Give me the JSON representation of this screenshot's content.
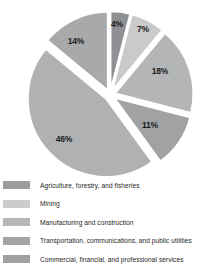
{
  "chart_data": {
    "type": "pie",
    "title": "",
    "subtitle": "",
    "xlabel": "",
    "ylabel": "",
    "grid": false,
    "legend_position": "bottom",
    "exploded": true,
    "start_angle_deg": 0,
    "direction": "clockwise",
    "categories": [
      "Agriculture, forestry, and fisheries",
      "Mining",
      "Manufacturing and construction",
      "Transportation, communications, and public utilities",
      "Commercial, financial, and professional services"
    ],
    "values": [
      4,
      7,
      18,
      11,
      46
    ],
    "slices": [
      {
        "label": "4%",
        "value": 4,
        "category": "Agriculture, forestry, and fisheries",
        "color": "#8f9093",
        "start_deg": 0,
        "end_deg": 14.4,
        "label_x": 117,
        "label_y": 24
      },
      {
        "label": "7%",
        "value": 7,
        "category": "Mining",
        "color": "#c9cacb",
        "start_deg": 14.4,
        "end_deg": 39.6,
        "label_x": 143,
        "label_y": 29
      },
      {
        "label": "18%",
        "value": 18,
        "category": "Manufacturing and construction",
        "color": "#b4b5b7",
        "start_deg": 39.6,
        "end_deg": 104.4,
        "label_x": 160,
        "label_y": 71
      },
      {
        "label": "11%",
        "value": 11,
        "category": "Transportation, communications, and public utilities",
        "color": "#a1a2a4",
        "start_deg": 104.4,
        "end_deg": 144.0,
        "label_x": 150,
        "label_y": 125
      },
      {
        "label": "46%",
        "value": 46,
        "category": "Commercial, financial, and professional services",
        "color": "#b0b1b3",
        "start_deg": 144.0,
        "end_deg": 309.6,
        "label_x": 64,
        "label_y": 139
      },
      {
        "label": "14%",
        "value": 14,
        "category": "",
        "color": "#a8a9ab",
        "start_deg": 309.6,
        "end_deg": 360.0,
        "label_x": 76,
        "label_y": 41
      }
    ],
    "percent_labels": [
      "4%",
      "7%",
      "18%",
      "11%",
      "46%",
      "14%"
    ]
  },
  "legend": {
    "items": [
      {
        "label": "Agriculture, forestry, and fisheries",
        "color": "#9b9c9e"
      },
      {
        "label": "Mining",
        "color": "#cbcccd"
      },
      {
        "label": "Manufacturing and construction",
        "color": "#b6b7b9"
      },
      {
        "label": "Transportation, communications, and public utilities",
        "color": "#a3a4a6"
      },
      {
        "label": "Commercial, financial, and professional services",
        "color": "#9fa0a2"
      }
    ]
  }
}
